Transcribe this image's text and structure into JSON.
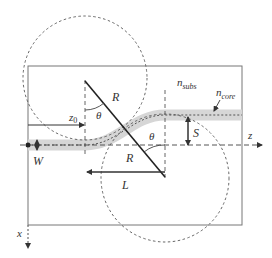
{
  "figure": {
    "labels": {
      "R_top": "R",
      "theta_top": "θ",
      "z0": "z",
      "z0_sub": "0",
      "n_subs": "n",
      "n_subs_sub": "subs",
      "n_core": "n",
      "n_core_sub": "core",
      "theta_right": "θ",
      "S": "S",
      "z_axis": "z",
      "W": "W",
      "R_bottom": "R",
      "L": "L",
      "x_axis": "x"
    },
    "colors": {
      "line": "#333333",
      "box": "#777777",
      "waveguide_fill": "#d6d6d6",
      "dashed": "#555555"
    }
  }
}
